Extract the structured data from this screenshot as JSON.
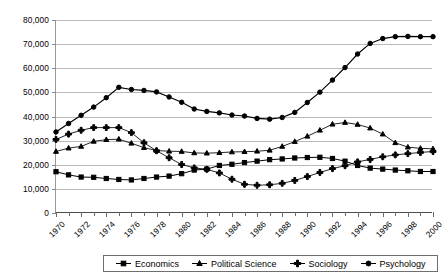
{
  "chart_data": {
    "type": "line",
    "title": "",
    "xlabel": "",
    "ylabel": "",
    "xlim": [
      1970,
      2000
    ],
    "ylim": [
      0,
      80000
    ],
    "grid": true,
    "legend_position": "bottom",
    "y_ticks": [
      0,
      10000,
      20000,
      30000,
      40000,
      50000,
      60000,
      70000,
      80000
    ],
    "y_tick_labels": [
      "0",
      "10,000",
      "20,000",
      "30,000",
      "40,000",
      "50,000",
      "60,000",
      "70,000",
      "80,000"
    ],
    "x": [
      1970,
      1971,
      1972,
      1973,
      1974,
      1975,
      1976,
      1977,
      1978,
      1979,
      1980,
      1981,
      1982,
      1983,
      1984,
      1985,
      1986,
      1987,
      1988,
      1989,
      1990,
      1991,
      1992,
      1993,
      1994,
      1995,
      1996,
      1997,
      1998,
      1999,
      2000
    ],
    "x_tick_labels": [
      "1970",
      "1972",
      "1974",
      "1976",
      "1978",
      "1980",
      "1982",
      "1984",
      "1986",
      "1988",
      "1990",
      "1992",
      "1994",
      "1996",
      "1998",
      "2000"
    ],
    "series": [
      {
        "name": "Economics",
        "marker": "square",
        "values": [
          17100,
          15800,
          14900,
          14800,
          14300,
          13900,
          13700,
          14300,
          14900,
          15300,
          16300,
          17800,
          18200,
          19700,
          20200,
          20900,
          21500,
          22100,
          22400,
          22800,
          23000,
          23100,
          22600,
          21500,
          19700,
          18600,
          18200,
          17800,
          17500,
          17200,
          17200
        ]
      },
      {
        "name": "Political Science",
        "marker": "triangle",
        "values": [
          25500,
          26900,
          27600,
          29700,
          30400,
          30600,
          28900,
          27100,
          25900,
          25600,
          25500,
          24900,
          24800,
          25000,
          25300,
          25400,
          25600,
          26000,
          27600,
          29600,
          31800,
          34300,
          36800,
          37500,
          36700,
          35200,
          32700,
          29100,
          27300,
          26800,
          26600
        ]
      },
      {
        "name": "Sociology",
        "marker": "plus",
        "values": [
          30500,
          32700,
          34300,
          35400,
          35400,
          35400,
          33300,
          29100,
          25800,
          22900,
          20100,
          18700,
          18100,
          16600,
          14000,
          11900,
          11500,
          11700,
          12300,
          13500,
          15100,
          16800,
          18400,
          19600,
          21200,
          22200,
          23300,
          24100,
          24600,
          25100,
          25500
        ]
      },
      {
        "name": "Psychology",
        "marker": "circle",
        "values": [
          33600,
          37100,
          40500,
          43900,
          47800,
          52100,
          51200,
          50800,
          50200,
          48100,
          45900,
          43100,
          42100,
          41500,
          40600,
          40200,
          39200,
          38900,
          39600,
          41700,
          45800,
          50100,
          55100,
          60300,
          65900,
          70300,
          72300,
          73100,
          73200,
          73100,
          73100
        ]
      }
    ]
  },
  "legend": {
    "items": [
      {
        "label": "Economics",
        "marker": "square"
      },
      {
        "label": "Political Science",
        "marker": "triangle"
      },
      {
        "label": "Sociology",
        "marker": "plus"
      },
      {
        "label": "Psychology",
        "marker": "circle"
      }
    ]
  },
  "colors": {
    "series": "#000000",
    "gridline": "#b9b9b9",
    "axis": "#4a4a4a",
    "background": "#ffffff"
  }
}
